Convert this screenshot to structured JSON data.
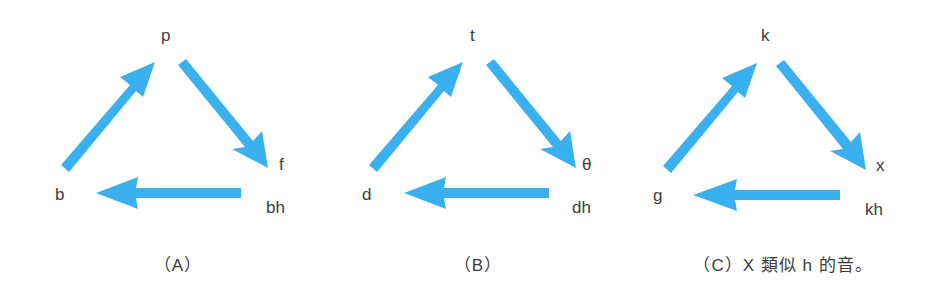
{
  "colors": {
    "arrow": "#3ab0ee",
    "text": "#3c3c3c",
    "background": "#ffffff"
  },
  "panels": [
    {
      "id": "A",
      "offset_x": 0,
      "top": "p",
      "right": "f",
      "right_bottom": "bh",
      "left": "b",
      "caption": "（A）",
      "cap_x": 178
    },
    {
      "id": "B",
      "offset_x": 306,
      "top": "t",
      "right": "θ",
      "right_bottom": "dh",
      "left": "d",
      "caption": "（B）",
      "cap_x": 478
    },
    {
      "id": "C",
      "offset_x": 600,
      "top": "k",
      "right": "x",
      "right_bottom": "kh",
      "left": "g",
      "caption": "（C）X 類似 h 的音。",
      "cap_x": 783
    }
  ],
  "edges": [
    {
      "from": "left",
      "to": "top",
      "direction": "up-right"
    },
    {
      "from": "top",
      "to": "right",
      "direction": "down-right"
    },
    {
      "from": "right_bottom",
      "to": "left",
      "direction": "left"
    }
  ]
}
